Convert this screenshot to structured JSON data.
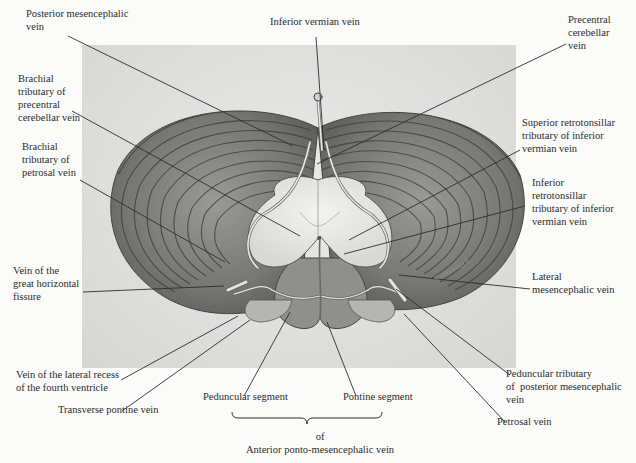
{
  "figure": {
    "signature": "©Sinovitech"
  },
  "labels": [
    {
      "id": "posterior-mesencephalic-vein",
      "text": "Posterior mesencephalic\nvein",
      "x": 26,
      "y": 17,
      "align": "left",
      "line": [
        68,
        36,
        293,
        146
      ]
    },
    {
      "id": "inferior-vermian-vein",
      "text": "Inferior vermian vein",
      "x": 270,
      "y": 25,
      "align": "left",
      "line": [
        316,
        37,
        324,
        150
      ]
    },
    {
      "id": "precentral-cerebellar-vein",
      "text": "Precentral\ncerebellar\nvein",
      "x": 568,
      "y": 23,
      "align": "left",
      "line": [
        566,
        44,
        317,
        164
      ]
    },
    {
      "id": "brachial-tributary-precentral",
      "text": "Brachial\ntributary of\nprecentral\ncerebellar vein",
      "x": 18,
      "y": 82,
      "align": "left",
      "line": [
        72,
        111,
        300,
        236
      ]
    },
    {
      "id": "superior-retrotonsillar",
      "text": "Superior retrotonsillar\ntributary of inferior\nvermian vein",
      "x": 522,
      "y": 126,
      "align": "left",
      "line": [
        520,
        150,
        349,
        240
      ]
    },
    {
      "id": "brachial-tributary-petrosal",
      "text": "Brachial\ntributary of\npetrosal vein",
      "x": 22,
      "y": 150,
      "align": "left",
      "line": [
        80,
        180,
        225,
        262
      ]
    },
    {
      "id": "inferior-retrotonsillar",
      "text": "Inferior\nretrotonsillar\ntributary of inferior\nvermian vein",
      "x": 532,
      "y": 186,
      "align": "left",
      "line": [
        525,
        206,
        344,
        254
      ]
    },
    {
      "id": "vein-great-horizontal-fissure",
      "text": "Vein of the\ngreat horizontal\nfissure",
      "x": 13,
      "y": 274,
      "align": "left",
      "line": [
        83,
        292,
        224,
        286
      ]
    },
    {
      "id": "lateral-mesencephalic-vein",
      "text": "Lateral\nmesencephalic vein",
      "x": 532,
      "y": 280,
      "align": "left",
      "line": [
        530,
        289,
        399,
        275
      ]
    },
    {
      "id": "vein-lateral-recess",
      "text": "Vein of the lateral recess\nof the fourth ventricle",
      "x": 16,
      "y": 378,
      "align": "left",
      "line": [
        121,
        380,
        238,
        316
      ]
    },
    {
      "id": "transverse-pontine-vein",
      "text": "Transverse pontine vein",
      "x": 58,
      "y": 413,
      "align": "left",
      "line": [
        122,
        411,
        250,
        320
      ]
    },
    {
      "id": "peduncular-tributary",
      "text": "Peduncular tributary\nof  posterior mesencephalic\nvein",
      "x": 506,
      "y": 377,
      "align": "left",
      "line": [
        510,
        375,
        396,
        289
      ]
    },
    {
      "id": "petrosal-vein",
      "text": "Petrosal vein",
      "x": 497,
      "y": 425,
      "align": "left",
      "line": [
        505,
        422,
        404,
        314
      ]
    },
    {
      "id": "peduncular-segment",
      "text": "Peduncular segment",
      "x": 203,
      "y": 400,
      "align": "left",
      "line": [
        244,
        396,
        290,
        312
      ]
    },
    {
      "id": "pontine-segment",
      "text": "Pontine segment",
      "x": 343,
      "y": 400,
      "align": "left",
      "line": [
        356,
        396,
        327,
        322
      ]
    }
  ],
  "group_caption": {
    "connector": "of",
    "text": "Anterior ponto-mesencephalic vein",
    "brace": [
      232,
      418,
      382,
      418
    ]
  }
}
